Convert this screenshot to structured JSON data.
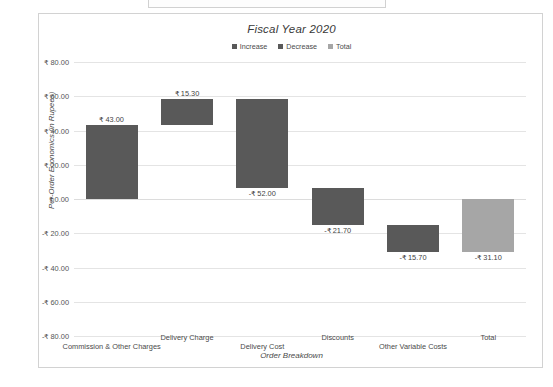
{
  "chart_data": {
    "type": "bar",
    "subtype": "waterfall",
    "title": "Fiscal Year 2020",
    "xlabel": "Order Breakdown",
    "ylabel": "Per-Order Economics (in Rupees)",
    "ylim": [
      -80,
      80
    ],
    "ytick_step": 20,
    "grid": true,
    "legend_position": "top-center",
    "currency_symbol": "₹",
    "categories": [
      "Commission & Other Charges",
      "Delivery Charge",
      "Delivery Cost",
      "Discounts",
      "Other Variable Costs",
      "Total"
    ],
    "values": [
      43.0,
      15.3,
      -52.0,
      -21.7,
      -15.7,
      -31.1
    ],
    "data_labels": [
      "₹ 43.00",
      "₹ 15.30",
      "-₹ 52.00",
      "-₹ 21.70",
      "-₹ 15.70",
      "-₹ 31.10"
    ],
    "bar_types": [
      "increase",
      "increase",
      "decrease",
      "decrease",
      "decrease",
      "total"
    ],
    "bar_bases": [
      0.0,
      43.0,
      58.3,
      6.3,
      -15.4,
      0.0
    ],
    "bar_tops": [
      43.0,
      58.3,
      6.3,
      -15.4,
      -31.1,
      -31.1
    ],
    "ytick_labels": [
      "₹ 80.00",
      "₹ 60.00",
      "₹ 40.00",
      "₹ 20.00",
      "₹ 0.00",
      "-₹ 20.00",
      "-₹ 40.00",
      "-₹ 60.00",
      "-₹ 80.00"
    ],
    "ytick_values": [
      80,
      60,
      40,
      20,
      0,
      -20,
      -40,
      -60,
      -80
    ],
    "legend": [
      {
        "label": "Increase",
        "color": "#595959"
      },
      {
        "label": "Decrease",
        "color": "#595959"
      },
      {
        "label": "Total",
        "color": "#a6a6a6"
      }
    ]
  }
}
